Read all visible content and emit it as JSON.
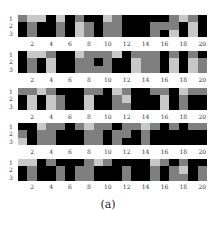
{
  "chart_data": {
    "type": "heatmap",
    "title": "",
    "caption": "(a)",
    "colormap": "grayscale",
    "levels": {
      "0": "#000000",
      "1": "#7f7f7f",
      "2": "#c8c8c8"
    },
    "x_ticks": [
      2,
      4,
      6,
      8,
      10,
      12,
      14,
      16,
      18,
      20
    ],
    "y_ticks": [
      1,
      2,
      3
    ],
    "n_cols": 20,
    "n_rows": 3,
    "panels": [
      {
        "rows": [
          [
            1,
            2,
            2,
            0,
            2,
            0,
            1,
            0,
            0,
            2,
            1,
            0,
            0,
            0,
            0,
            0,
            1,
            2,
            1,
            0
          ],
          [
            0,
            1,
            0,
            0,
            1,
            0,
            2,
            1,
            0,
            1,
            1,
            0,
            0,
            0,
            1,
            1,
            1,
            0,
            2,
            0
          ],
          [
            0,
            1,
            0,
            0,
            1,
            0,
            2,
            1,
            0,
            1,
            1,
            0,
            0,
            0,
            1,
            0,
            2,
            0,
            2,
            0
          ]
        ]
      },
      {
        "rows": [
          [
            0,
            2,
            2,
            1,
            0,
            0,
            2,
            1,
            1,
            1,
            2,
            0,
            1,
            1,
            1,
            0,
            1,
            0,
            1,
            0
          ],
          [
            0,
            1,
            0,
            2,
            0,
            0,
            1,
            1,
            0,
            1,
            0,
            0,
            2,
            1,
            1,
            0,
            2,
            0,
            2,
            1
          ],
          [
            0,
            1,
            0,
            2,
            0,
            0,
            1,
            1,
            1,
            1,
            0,
            0,
            2,
            1,
            1,
            0,
            2,
            0,
            2,
            1
          ]
        ]
      },
      {
        "rows": [
          [
            1,
            1,
            2,
            1,
            0,
            0,
            0,
            1,
            1,
            0,
            2,
            1,
            0,
            0,
            1,
            1,
            0,
            2,
            1,
            1
          ],
          [
            0,
            2,
            0,
            2,
            1,
            0,
            0,
            2,
            0,
            0,
            1,
            2,
            0,
            0,
            0,
            2,
            0,
            1,
            0,
            0
          ],
          [
            0,
            2,
            0,
            2,
            1,
            0,
            0,
            2,
            0,
            0,
            1,
            1,
            0,
            0,
            0,
            2,
            0,
            1,
            0,
            0
          ]
        ]
      },
      {
        "rows": [
          [
            0,
            0,
            2,
            1,
            1,
            0,
            1,
            2,
            1,
            1,
            0,
            1,
            1,
            2,
            1,
            0,
            1,
            0,
            1,
            1
          ],
          [
            1,
            0,
            1,
            1,
            0,
            0,
            0,
            1,
            1,
            0,
            1,
            1,
            0,
            1,
            0,
            0,
            0,
            0,
            0,
            0
          ],
          [
            2,
            0,
            1,
            1,
            0,
            0,
            0,
            1,
            1,
            0,
            1,
            0,
            0,
            1,
            0,
            0,
            0,
            0,
            0,
            0
          ]
        ]
      },
      {
        "rows": [
          [
            2,
            2,
            0,
            1,
            0,
            0,
            0,
            1,
            2,
            1,
            0,
            0,
            0,
            0,
            2,
            1,
            0,
            1,
            0,
            0
          ],
          [
            0,
            1,
            0,
            0,
            1,
            0,
            1,
            1,
            0,
            0,
            0,
            1,
            0,
            0,
            1,
            0,
            1,
            2,
            0,
            1
          ],
          [
            0,
            1,
            0,
            0,
            1,
            0,
            1,
            1,
            0,
            0,
            0,
            1,
            0,
            0,
            1,
            0,
            1,
            1,
            0,
            1
          ]
        ]
      }
    ]
  }
}
